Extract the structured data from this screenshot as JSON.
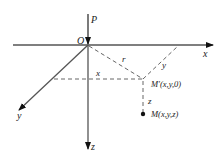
{
  "diagram": {
    "type": "3d-coordinate-system",
    "labels": {
      "origin": "O",
      "force": "P",
      "x_axis": "x",
      "y_axis": "y",
      "z_axis": "z",
      "r_segment": "r",
      "x_segment": "x",
      "y_segment": "y",
      "z_segment": "z",
      "projection_point": "M′(x,y,0)",
      "point": "M(x,y,z)"
    },
    "colors": {
      "axis": "#555555",
      "dashed": "#666666",
      "arrow": "#111111",
      "text": "#222222"
    }
  }
}
